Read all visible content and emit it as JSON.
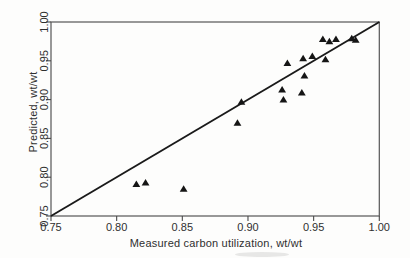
{
  "style": {
    "background": "#fdfdfc",
    "axis_color": "#4a4a4a",
    "frame_color": "#565656",
    "text_color": "#2f2f2f"
  },
  "chart_data": {
    "type": "scatter",
    "title": "",
    "xlabel": "Measured carbon utilization, wt/wt",
    "ylabel": "Predicted, wt/wt",
    "xlim": [
      0.75,
      1.0
    ],
    "ylim": [
      0.75,
      1.0
    ],
    "xticks": [
      0.75,
      0.8,
      0.85,
      0.9,
      0.95,
      1.0
    ],
    "yticks": [
      0.75,
      0.8,
      0.85,
      0.9,
      0.95,
      1.0
    ],
    "tick_decimals": 2,
    "grid": false,
    "legend": null,
    "series": [
      {
        "name": "predicted-vs-measured",
        "marker": "filled-triangle-up",
        "color": "#151515",
        "points": [
          [
            0.815,
            0.791
          ],
          [
            0.822,
            0.793
          ],
          [
            0.851,
            0.785
          ],
          [
            0.892,
            0.87
          ],
          [
            0.895,
            0.897
          ],
          [
            0.926,
            0.913
          ],
          [
            0.927,
            0.9
          ],
          [
            0.93,
            0.947
          ],
          [
            0.941,
            0.909
          ],
          [
            0.943,
            0.931
          ],
          [
            0.942,
            0.953
          ],
          [
            0.949,
            0.956
          ],
          [
            0.957,
            0.978
          ],
          [
            0.959,
            0.952
          ],
          [
            0.962,
            0.975
          ],
          [
            0.967,
            0.978
          ],
          [
            0.979,
            0.979
          ],
          [
            0.982,
            0.977
          ]
        ]
      }
    ],
    "reference_line": {
      "type": "y=x",
      "from": [
        0.75,
        0.75
      ],
      "to": [
        1.0,
        1.0
      ],
      "color": "#1a1a1a"
    }
  }
}
